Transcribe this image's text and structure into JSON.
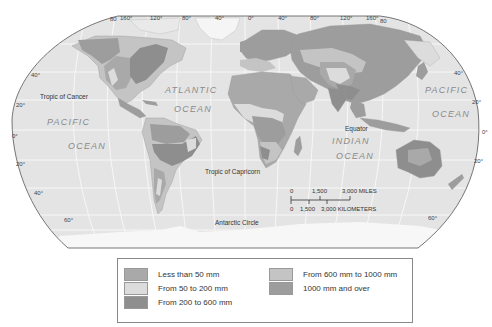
{
  "map": {
    "projection": "world",
    "longitude_labels_top": [
      "160°",
      "120°",
      "80°",
      "40°",
      "0°",
      "40°",
      "80°",
      "120°",
      "160°"
    ],
    "edge_labels": {
      "top_left": "80",
      "top_right": "80"
    },
    "latitude_labels_left": [
      "40°",
      "20°",
      "0°",
      "20°",
      "40°",
      "60°"
    ],
    "latitude_labels_right": [
      "40°",
      "20°",
      "0°",
      "20°",
      "60°"
    ],
    "lines": {
      "tropic_of_cancer": "Tropic of Cancer",
      "tropic_of_capricorn": "Tropic of Capricorn",
      "equator": "Equator",
      "antarctic_circle": "Antarctic Circle"
    },
    "oceans": {
      "atlantic_1": "ATLANTIC",
      "atlantic_2": "OCEAN",
      "pacific_left_1": "PACIFIC",
      "pacific_left_2": "OCEAN",
      "pacific_right_1": "PACIFIC",
      "pacific_right_2": "OCEAN",
      "indian_1": "INDIAN",
      "indian_2": "OCEAN"
    },
    "scale": {
      "miles_labels": [
        "0",
        "1,500",
        "3,000 MILES"
      ],
      "km_labels": [
        "0",
        "1,500",
        "3,000 KILOMETERS"
      ]
    },
    "colors": {
      "ocean": "#e4e4e4",
      "graticule": "#f6f6f6",
      "frame": "#555555",
      "ice": "#f7f7f7"
    }
  },
  "legend": {
    "items": [
      {
        "label": "Less than 50 mm",
        "color": "#a9a9a9"
      },
      {
        "label": "From 50 to 200 mm",
        "color": "#dcdcdc"
      },
      {
        "label": "From 200 to 600 mm",
        "color": "#8e8e8e"
      },
      {
        "label": "From 600 mm to 1000 mm",
        "color": "#c4c4c4"
      },
      {
        "label": "1000 mm and over",
        "color": "#9d9d9d"
      }
    ]
  }
}
